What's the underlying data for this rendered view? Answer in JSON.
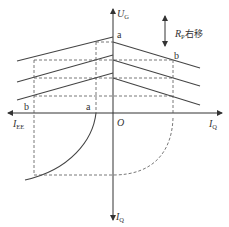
{
  "diagram": {
    "axes": {
      "vertical_up": {
        "main": "U",
        "sub": "G"
      },
      "horizontal_right": {
        "main": "I",
        "sub": "Q"
      },
      "horizontal_left": {
        "main": "I",
        "sub": "EE"
      },
      "vertical_down": {
        "main": "I",
        "sub": "Q"
      },
      "origin": "O"
    },
    "points": {
      "a_top": "a",
      "b_right": "b",
      "b_left": "b",
      "a_left": "a"
    },
    "annotation": {
      "main": "R",
      "sub": "P",
      "text": "右移"
    }
  }
}
